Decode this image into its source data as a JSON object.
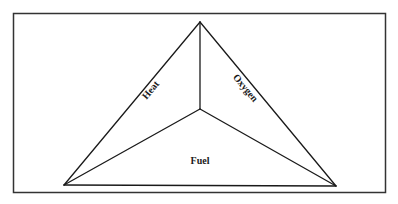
{
  "diagram": {
    "type": "fire-tetrahedron",
    "frame": {
      "x": 13,
      "y": 13,
      "width": 373,
      "height": 180
    },
    "vertices": {
      "apex": [
        200,
        22
      ],
      "bottom_left": [
        64,
        185
      ],
      "bottom_right": [
        336,
        186
      ],
      "center": [
        200,
        109
      ]
    },
    "labels": {
      "heat": "Heat",
      "oxygen": "Oxygen",
      "fuel": "Fuel"
    },
    "colors": {
      "line": "#1a1a1a",
      "frame": "#333333",
      "background": "#ffffff"
    }
  }
}
